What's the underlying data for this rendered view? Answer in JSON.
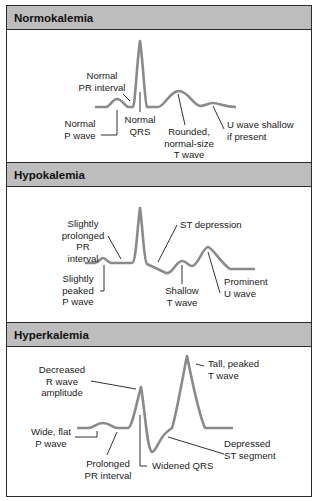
{
  "panels": [
    {
      "title": "Normokalemia",
      "labels": {
        "pr_interval": "Normal\nPR interval",
        "p_wave": "Normal\nP wave",
        "qrs": "Normal\nQRS",
        "t_wave": "Rounded,\nnormal-size\nT wave",
        "u_wave": "U wave shallow\nif present"
      }
    },
    {
      "title": "Hypokalemia",
      "labels": {
        "pr_interval": "Slightly\nprolonged\nPR interval",
        "p_wave": "Slightly\npeaked\nP wave",
        "st": "ST depression",
        "t_wave": "Shallow\nT wave",
        "u_wave": "Prominent\nU wave"
      }
    },
    {
      "title": "Hyperkalemia",
      "labels": {
        "r_wave": "Decreased\nR wave\namplitude",
        "p_wave": "Wide, flat\nP wave",
        "pr_interval": "Prolonged\nPR interval",
        "qrs": "Widened QRS",
        "st": "Depressed\nST segment",
        "t_wave": "Tall, peaked\nT wave"
      }
    }
  ],
  "colors": {
    "trace": "#8a8a8a",
    "leader": "#1a1a1a",
    "header_bg": "#bdbdbd",
    "border": "#2a2a2a"
  }
}
